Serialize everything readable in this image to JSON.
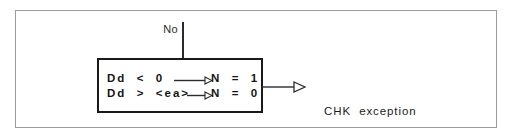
{
  "diagram": {
    "colors": {
      "outer_frame": "#9a9a9a",
      "box_border": "#1a1a1a",
      "line": "#2b2b2b",
      "text": "#151515",
      "background": "#ffffff"
    },
    "branch_label": "No",
    "condition_box": {
      "rows": [
        {
          "condition": "Dd  <  0",
          "result": "N  =  1"
        },
        {
          "condition": "Dd  >  <ea>",
          "result": "N  =  0"
        }
      ]
    },
    "destination": {
      "line_1": "CHK  exception",
      "line_2": "handling"
    },
    "icons": {
      "inner_arrowhead": "small-open-triangle-arrowhead",
      "outgoing_arrowhead": "open-triangle-arrowhead"
    }
  }
}
